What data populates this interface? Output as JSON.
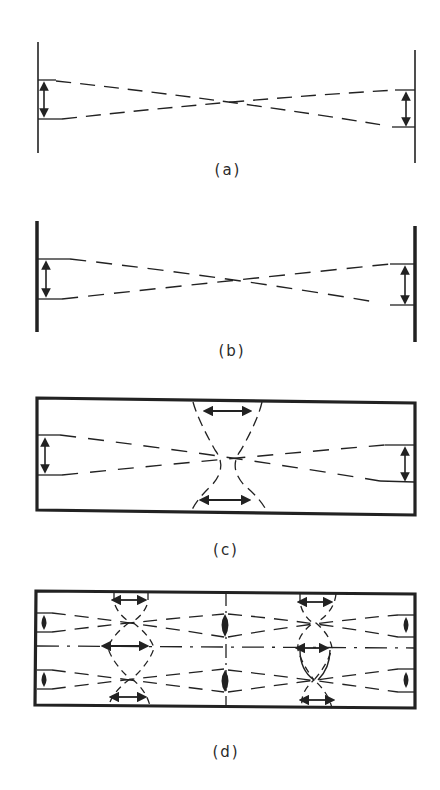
{
  "figure": {
    "panels": [
      {
        "id": "a",
        "label": "(a)",
        "mirrors": "thin plane mirrors",
        "beam": "crossed dashed beam edges with vertical double arrows at mirrors"
      },
      {
        "id": "b",
        "label": "(b)",
        "mirrors": "thick plane mirrors",
        "beam": "crossed dashed beam edges with vertical double arrows at mirrors"
      },
      {
        "id": "c",
        "label": "(c)",
        "mirrors": "closed waveguide box",
        "beam": "crossed dashed beam edges with central waist, arcs and horizontal double arrows at top and bottom walls"
      },
      {
        "id": "d",
        "label": "(d)",
        "mirrors": "closed waveguide box with center divider",
        "beam": "two stacked beams, dash-dot axis, two waist regions with arcs and horizontal double arrows"
      }
    ],
    "colors": {
      "ink": "#222222",
      "background": "#ffffff"
    }
  }
}
